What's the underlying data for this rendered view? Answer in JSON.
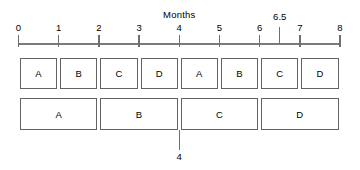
{
  "axis": {
    "title": "Months",
    "min": 0,
    "max": 8,
    "ticks": [
      {
        "value": 0,
        "label": "0"
      },
      {
        "value": 1,
        "label": "1"
      },
      {
        "value": 2,
        "label": "2"
      },
      {
        "value": 3,
        "label": "3"
      },
      {
        "value": 4,
        "label": "4"
      },
      {
        "value": 5,
        "label": "5"
      },
      {
        "value": 6,
        "label": "6"
      },
      {
        "value": 7,
        "label": "7"
      },
      {
        "value": 8,
        "label": "8"
      }
    ],
    "marker": {
      "value": 6.5,
      "label": "6.5"
    },
    "line_color": "#7a7a7a"
  },
  "row_top": {
    "name": "short-tasks-row",
    "boxes": [
      {
        "label": "A",
        "start": 0,
        "end": 1
      },
      {
        "label": "B",
        "start": 1,
        "end": 2
      },
      {
        "label": "C",
        "start": 2,
        "end": 3
      },
      {
        "label": "D",
        "start": 3,
        "end": 4
      },
      {
        "label": "A",
        "start": 4,
        "end": 5
      },
      {
        "label": "B",
        "start": 5,
        "end": 6
      },
      {
        "label": "C",
        "start": 6,
        "end": 7
      },
      {
        "label": "D",
        "start": 7,
        "end": 8
      }
    ]
  },
  "row_bottom": {
    "name": "long-tasks-row",
    "boxes": [
      {
        "label": "A",
        "start": 0,
        "end": 2
      },
      {
        "label": "B",
        "start": 2,
        "end": 4
      },
      {
        "label": "C",
        "start": 4,
        "end": 6
      },
      {
        "label": "D",
        "start": 6,
        "end": 8
      }
    ]
  },
  "callout": {
    "value": 4,
    "label": "4"
  },
  "colors": {
    "box_border": "#636363",
    "axis": "#7a7a7a",
    "text": "#000000",
    "background": "#ffffff"
  }
}
